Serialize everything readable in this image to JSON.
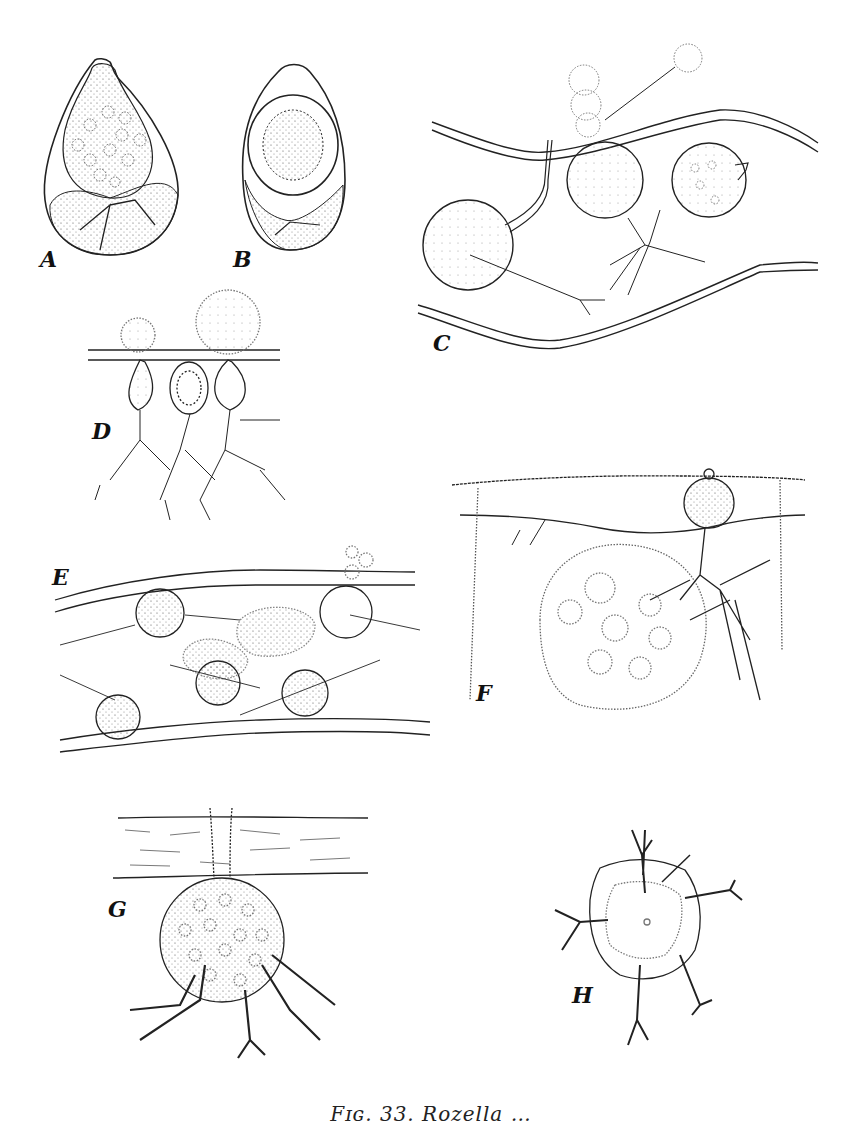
{
  "figure": {
    "caption_partial": "Fɪɢ. 33. Rozella …",
    "panels": [
      {
        "id": "A",
        "label": "A"
      },
      {
        "id": "B",
        "label": "B"
      },
      {
        "id": "C",
        "label": "C"
      },
      {
        "id": "D",
        "label": "D"
      },
      {
        "id": "E",
        "label": "E"
      },
      {
        "id": "F",
        "label": "F"
      },
      {
        "id": "G",
        "label": "G"
      },
      {
        "id": "H",
        "label": "H"
      }
    ]
  }
}
